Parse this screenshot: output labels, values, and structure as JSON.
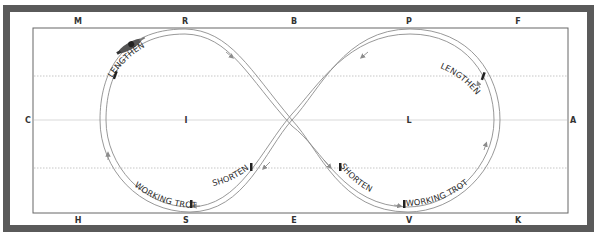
{
  "diagram": {
    "arena_markers": {
      "top": [
        "M",
        "R",
        "B",
        "P",
        "F"
      ],
      "bottom": [
        "H",
        "S",
        "E",
        "V",
        "K"
      ],
      "left": "C",
      "right": "A",
      "centerline": [
        "I",
        "L"
      ]
    },
    "cues": {
      "left_top": "LENGTHEN",
      "right_top": "LENGTHEN",
      "left_shorten": "SHORTEN",
      "right_shorten": "SHORTEN",
      "left_working": "WORKING TROT",
      "right_working": "WORKING TROT"
    },
    "colors": {
      "frame": "#5a5a5a",
      "arena_line": "#666666",
      "quarter_line": "#b8b8b8",
      "path": "#8c8c8c",
      "marker_text": "#333333"
    }
  }
}
